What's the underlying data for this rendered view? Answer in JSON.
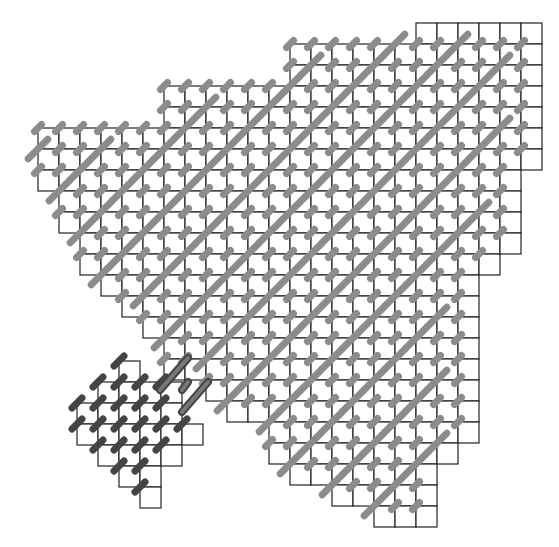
{
  "diagram": {
    "type": "lattice-region-tiling",
    "grid": {
      "origin_x": 38,
      "origin_y": 23,
      "cell": 21
    },
    "colors": {
      "cell_stroke": "#222222",
      "bond": "#8c8c8c",
      "cluster_bond": "#444444",
      "background": "#ffffff"
    },
    "main_region_rows": [
      {
        "r": 0,
        "c0": 18,
        "c1": 23
      },
      {
        "r": 1,
        "c0": 12,
        "c1": 23
      },
      {
        "r": 2,
        "c0": 12,
        "c1": 23
      },
      {
        "r": 3,
        "c0": 6,
        "c1": 23
      },
      {
        "r": 4,
        "c0": 6,
        "c1": 23
      },
      {
        "r": 5,
        "c0": 0,
        "c1": 23
      },
      {
        "r": 6,
        "c0": 0,
        "c1": 23
      },
      {
        "r": 7,
        "c0": 0,
        "c1": 22
      },
      {
        "r": 8,
        "c0": 1,
        "c1": 22
      },
      {
        "r": 9,
        "c0": 1,
        "c1": 22
      },
      {
        "r": 10,
        "c0": 2,
        "c1": 22
      },
      {
        "r": 11,
        "c0": 2,
        "c1": 21
      },
      {
        "r": 12,
        "c0": 3,
        "c1": 20
      },
      {
        "r": 13,
        "c0": 4,
        "c1": 20
      },
      {
        "r": 14,
        "c0": 5,
        "c1": 20
      },
      {
        "r": 15,
        "c0": 6,
        "c1": 20
      },
      {
        "r": 16,
        "c0": 6,
        "c1": 20
      },
      {
        "r": 17,
        "c0": 8,
        "c1": 20
      },
      {
        "r": 18,
        "c0": 9,
        "c1": 20
      },
      {
        "r": 19,
        "c0": 11,
        "c1": 20
      },
      {
        "r": 20,
        "c0": 11,
        "c1": 19
      },
      {
        "r": 21,
        "c0": 12,
        "c1": 18
      },
      {
        "r": 22,
        "c0": 14,
        "c1": 18
      },
      {
        "r": 23,
        "c0": 16,
        "c1": 18
      }
    ],
    "cluster_rows": [
      {
        "r": 16,
        "c0": 4,
        "c1": 4
      },
      {
        "r": 17,
        "c0": 3,
        "c1": 6
      },
      {
        "r": 18,
        "c0": 2,
        "c1": 6
      },
      {
        "r": 19,
        "c0": 2,
        "c1": 7
      },
      {
        "r": 20,
        "c0": 3,
        "c1": 6
      },
      {
        "r": 21,
        "c0": 4,
        "c1": 5
      },
      {
        "r": 22,
        "c0": 5,
        "c1": 5
      }
    ],
    "highlight_bonds": [
      {
        "x1": 160,
        "y1": 390,
        "x2": 188,
        "y2": 358
      },
      {
        "x1": 182,
        "y1": 390,
        "x2": 188,
        "y2": 382
      },
      {
        "x1": 182,
        "y1": 412,
        "x2": 208,
        "y2": 382
      }
    ]
  }
}
